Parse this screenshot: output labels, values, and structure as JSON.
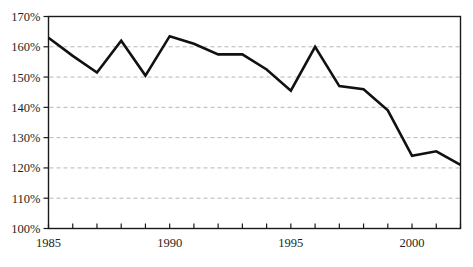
{
  "chart_data": {
    "type": "line",
    "title": "",
    "subtitle": "",
    "xlabel": "",
    "ylabel": "",
    "x": [
      1985,
      1986,
      1987,
      1988,
      1989,
      1990,
      1991,
      1992,
      1993,
      1994,
      1995,
      1996,
      1997,
      1998,
      1999,
      2000,
      2001,
      2002
    ],
    "values": [
      163.0,
      157.0,
      151.5,
      162.0,
      150.5,
      163.5,
      161.0,
      157.5,
      157.5,
      152.5,
      145.5,
      160.0,
      147.0,
      146.0,
      139.0,
      124.0,
      125.5,
      121.0
    ],
    "series": [
      {
        "name": "series-1",
        "values": [
          163.0,
          157.0,
          151.5,
          162.0,
          150.5,
          163.5,
          161.0,
          157.5,
          157.5,
          152.5,
          145.5,
          160.0,
          147.0,
          146.0,
          139.0,
          124.0,
          125.5,
          121.0
        ]
      }
    ],
    "xlim": [
      1985,
      2002
    ],
    "ylim": [
      100,
      170
    ],
    "ytick_values": [
      100,
      110,
      120,
      130,
      140,
      150,
      160,
      170
    ],
    "ytick_labels": [
      "100%",
      "110%",
      "120%",
      "130%",
      "140%",
      "150%",
      "160%",
      "170%"
    ],
    "xtick_values": [
      1985,
      1986,
      1987,
      1988,
      1989,
      1990,
      1991,
      1992,
      1993,
      1994,
      1995,
      1996,
      1997,
      1998,
      1999,
      2000,
      2001,
      2002
    ],
    "xtick_labels_shown": [
      {
        "value": 1985,
        "label": "1985"
      },
      {
        "value": 1990,
        "label": "1990"
      },
      {
        "value": 1995,
        "label": "1995"
      },
      {
        "value": 2000,
        "label": "2000"
      }
    ],
    "grid": {
      "horizontal": true,
      "vertical": false,
      "style": "dashed"
    },
    "legend": {
      "visible": false,
      "position": "none"
    },
    "colors": {
      "line": "#111111",
      "grid": "#b7b7b7",
      "axis": "#1a1a1a",
      "background": "#ffffff",
      "text": "#231f20"
    },
    "line_width": 2.6
  }
}
